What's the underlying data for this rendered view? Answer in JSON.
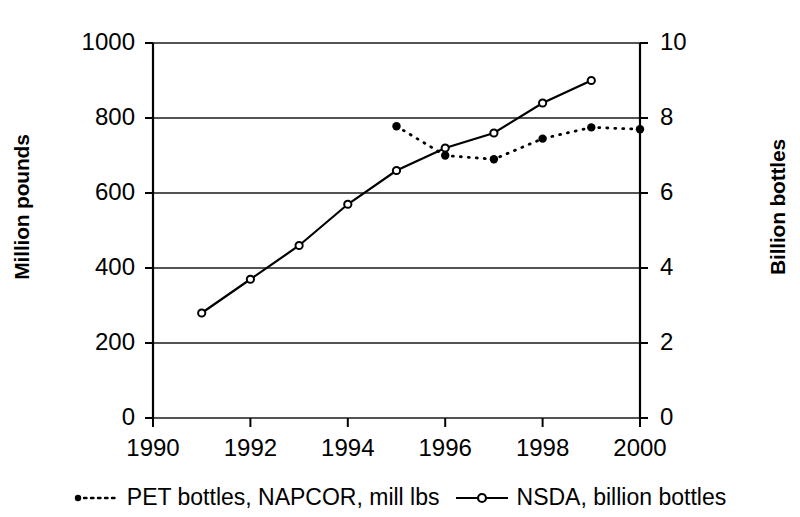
{
  "chart_data": {
    "type": "line",
    "title": "",
    "xlabel": "",
    "ylabel": "Million pounds",
    "ylabel_right": "Billion bottles",
    "xlim": [
      1990,
      2000
    ],
    "ylim": [
      0,
      1000
    ],
    "ylim_right": [
      0,
      10
    ],
    "xticks": [
      "1990",
      "1992",
      "1994",
      "1996",
      "1998",
      "2000"
    ],
    "xtick_values": [
      1990,
      1992,
      1994,
      1996,
      1998,
      2000
    ],
    "yticks": [
      "0",
      "200",
      "400",
      "600",
      "800",
      "1000"
    ],
    "ytick_values": [
      0,
      200,
      400,
      600,
      800,
      1000
    ],
    "yticks_right": [
      "0",
      "2",
      "4",
      "6",
      "8",
      "10"
    ],
    "ytick_values_right": [
      0,
      2,
      4,
      6,
      8,
      10
    ],
    "grid": true,
    "legend_position": "bottom",
    "series": [
      {
        "name": "PET bottles, NAPCOR, mill lbs",
        "axis": "left",
        "style": "dotted",
        "marker": "filled-circle",
        "color": "#000000",
        "x": [
          1995,
          1996,
          1997,
          1998,
          1999,
          2000
        ],
        "values": [
          778,
          700,
          690,
          745,
          775,
          770
        ]
      },
      {
        "name": "NSDA, billion bottles",
        "axis": "right",
        "style": "solid",
        "marker": "open-circle",
        "color": "#000000",
        "x": [
          1991,
          1992,
          1993,
          1994,
          1995,
          1996,
          1997,
          1998,
          1999
        ],
        "values": [
          2.8,
          3.7,
          4.6,
          5.7,
          6.6,
          7.2,
          7.6,
          8.4,
          9.0
        ],
        "values_left_scale": [
          280,
          370,
          458,
          573,
          660,
          718,
          762,
          843,
          904
        ]
      }
    ]
  },
  "legend": {
    "items": [
      {
        "label": "PET bottles, NAPCOR, mill lbs",
        "marker": "dotted-line-dot"
      },
      {
        "label": "NSDA, billion bottles",
        "marker": "solid-line-circle"
      }
    ]
  }
}
